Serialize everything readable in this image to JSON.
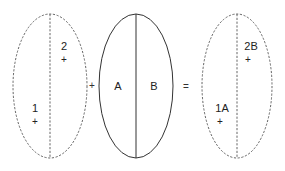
{
  "diagram": {
    "left_shape": {
      "style": "dashed",
      "labels": [
        "2",
        "1"
      ],
      "markers": [
        "+",
        "+"
      ]
    },
    "plus_operator": "+",
    "middle_shape": {
      "style": "solid",
      "labels": [
        "A",
        "B"
      ]
    },
    "equals_operator": "=",
    "right_shape": {
      "style": "dashed",
      "labels": [
        "2B",
        "1A"
      ],
      "markers": [
        "+",
        "+"
      ]
    }
  }
}
